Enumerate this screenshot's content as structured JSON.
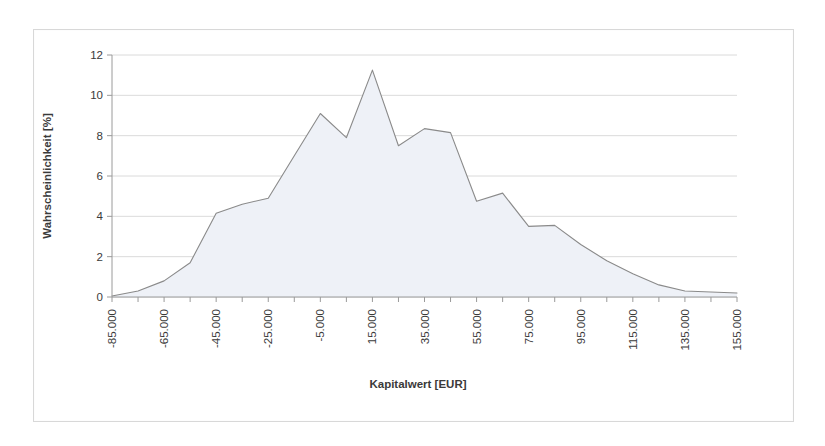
{
  "chart_data": {
    "type": "area",
    "title": "",
    "xlabel": "Kapitalwert [EUR]",
    "ylabel": "Wahrscheinlichkeit [%]",
    "xlim": [
      -85000,
      155000
    ],
    "ylim": [
      0,
      12
    ],
    "ytick_step": 2,
    "xtick_step": 20000,
    "x_minor_step": 10000,
    "grid": "horizontal",
    "legend": "none",
    "line_color": "#8a8a8a",
    "fill_color": "#eef1f7",
    "grid_color": "#d0d0d0",
    "axis_color": "#9a9a9a",
    "x_tick_labels": [
      "-85.000",
      "-65.000",
      "-45.000",
      "-25.000",
      "-5.000",
      "15.000",
      "35.000",
      "55.000",
      "75.000",
      "95.000",
      "115.000",
      "135.000",
      "155.000"
    ],
    "y_tick_labels": [
      "0",
      "2",
      "4",
      "6",
      "8",
      "10",
      "12"
    ],
    "x": [
      -85000,
      -75000,
      -65000,
      -55000,
      -45000,
      -35000,
      -25000,
      -15000,
      -5000,
      5000,
      15000,
      25000,
      35000,
      45000,
      55000,
      65000,
      75000,
      85000,
      95000,
      105000,
      115000,
      125000,
      135000,
      145000,
      155000
    ],
    "values": [
      0.05,
      0.3,
      0.8,
      1.7,
      4.15,
      4.6,
      4.9,
      7.0,
      9.1,
      7.9,
      11.25,
      7.5,
      8.35,
      8.15,
      4.75,
      5.15,
      3.5,
      3.55,
      2.6,
      1.8,
      1.15,
      0.6,
      0.3,
      0.25,
      0.2
    ],
    "series_name": "Wahrscheinlichkeit"
  }
}
